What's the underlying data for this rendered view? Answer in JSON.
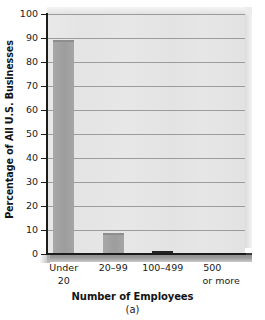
{
  "chart_data": {
    "type": "bar",
    "title": "",
    "categories": [
      "Under 20",
      "20–99",
      "100–499",
      "500 or more"
    ],
    "category_lines": [
      [
        "Under",
        "20"
      ],
      [
        "20–99",
        ""
      ],
      [
        "100–499",
        ""
      ],
      [
        "500",
        "or more"
      ]
    ],
    "values": [
      89,
      8.6,
      1.1,
      0.3
    ],
    "xlabel": "Number of Employees",
    "ylabel": "Percentage of All U.S. Businesses",
    "ylim": [
      0,
      100
    ],
    "ytick_step": 10,
    "yticks": [
      100,
      90,
      80,
      70,
      60,
      50,
      40,
      30,
      20,
      10,
      0
    ],
    "ytick_labels": [
      "100",
      "90",
      "80",
      "70",
      "60",
      "50",
      "40",
      "30",
      "20",
      "10",
      "0"
    ],
    "grid": true,
    "grid_axis": "y",
    "legend": null,
    "caption": "(a)",
    "bar_colors": [
      "#9d9d9d",
      "#9d9d9d",
      "#2f2f2f",
      "#2f2f2f"
    ],
    "plot_background": "#e6e6e6",
    "grid_color": "#9c9c9c",
    "axis_color": "#1c1c1c",
    "style": "3d-shadow-bar"
  },
  "figure": {
    "ylabel": "Percentage of All U.S. Businesses",
    "xlabel": "Number of Employees",
    "caption": "(a)"
  }
}
